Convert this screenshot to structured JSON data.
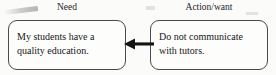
{
  "diagram": {
    "type": "flow",
    "direction": "right-to-left",
    "background_color": "#fbfbf9",
    "columns": [
      {
        "id": "need",
        "label": "Need"
      },
      {
        "id": "action",
        "label": "Action/want"
      }
    ],
    "nodes": [
      {
        "id": "need",
        "column": "need",
        "text": "My students have a quality education.",
        "shape": "rounded-rectangle",
        "border_color": "#4a4a4a",
        "fill_color": "#fdfdfb"
      },
      {
        "id": "action",
        "column": "action",
        "text": "Do not communicate with tutors.",
        "shape": "rounded-rectangle",
        "border_color": "#4a4a4a",
        "fill_color": "#fdfdfb"
      }
    ],
    "connector": {
      "id": "action-to-need",
      "from": "action",
      "to": "need",
      "style": "solid",
      "arrowhead": "left",
      "color": "#141414"
    }
  }
}
